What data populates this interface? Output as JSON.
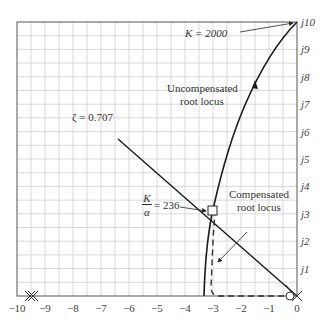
{
  "figure": {
    "type": "root-locus",
    "x_ticks": [
      "−10",
      "−9",
      "−8",
      "−7",
      "−6",
      "−5",
      "−4",
      "−3",
      "−2",
      "−1",
      "0"
    ],
    "y_ticks": [
      "j1",
      "j2",
      "j3",
      "j4",
      "j5",
      "j6",
      "j7",
      "j8",
      "j9",
      "j10"
    ],
    "annotations": {
      "k_2000": "K = 2000",
      "uncompensated_line1": "Uncompensated",
      "uncompensated_line2": "root locus",
      "zeta": "ζ = 0.707",
      "k_alpha_num": "K",
      "k_alpha_den": "α",
      "k_alpha_val": "= 236",
      "compensated_line1": "Compensated",
      "compensated_line2": "root locus"
    },
    "colors": {
      "grid": "#c8c8c8",
      "curve": "#1a1a1a",
      "axis": "#555555"
    }
  },
  "chart_data": {
    "type": "line",
    "title": "",
    "xlabel": "σ",
    "ylabel": "jω",
    "xlim": [
      -10,
      0
    ],
    "ylim": [
      0,
      10
    ],
    "grid": true,
    "series": [
      {
        "name": "Uncompensated root locus",
        "style": "solid",
        "points": [
          [
            -3.33,
            0
          ],
          [
            -3.2,
            1.5
          ],
          [
            -3,
            3
          ],
          [
            -2.6,
            5
          ],
          [
            -2.1,
            7
          ],
          [
            -1.4,
            8.6
          ],
          [
            0,
            10
          ]
        ]
      },
      {
        "name": "Compensated root locus",
        "style": "dashed",
        "points": [
          [
            -0.1,
            0
          ],
          [
            -2.8,
            0
          ],
          [
            -3.0,
            0.3
          ],
          [
            -2.9,
            2
          ],
          [
            -2.85,
            3.1
          ]
        ]
      },
      {
        "name": "ζ = 0.707 line",
        "style": "solid",
        "points": [
          [
            0,
            0
          ],
          [
            -5.6,
            5.6
          ]
        ]
      }
    ],
    "markers": [
      {
        "type": "pole-x",
        "x": -10,
        "y": 0
      },
      {
        "type": "pole-x",
        "x": 0,
        "y": 0
      },
      {
        "type": "zero-o",
        "x": -0.1,
        "y": 0
      },
      {
        "type": "square",
        "x": -2.9,
        "y": 3.08,
        "label": "K/α = 236"
      }
    ],
    "annotations": [
      "K = 2000",
      "Uncompensated root locus",
      "ζ = 0.707",
      "K/α = 236",
      "Compensated root locus"
    ]
  }
}
